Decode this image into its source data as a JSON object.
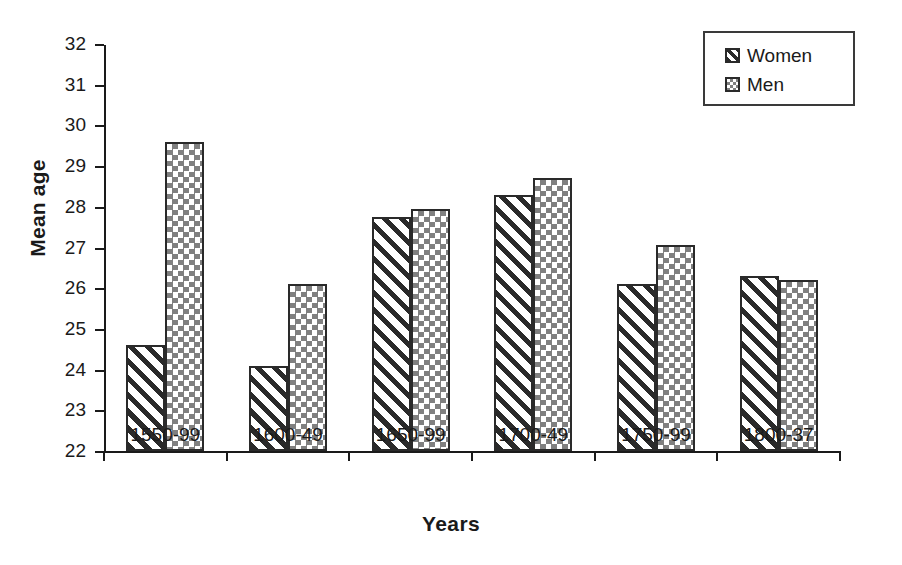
{
  "chart_data": {
    "type": "bar",
    "title": "",
    "xlabel": "Years",
    "ylabel": "Mean age",
    "categories": [
      "1550-99",
      "1600-49",
      "1650-99",
      "1700-49",
      "1750-99",
      "1800-37"
    ],
    "series": [
      {
        "name": "Women",
        "values": [
          24.6,
          24.1,
          27.75,
          28.3,
          26.1,
          26.3
        ]
      },
      {
        "name": "Men",
        "values": [
          29.6,
          26.1,
          27.95,
          28.7,
          27.05,
          26.2
        ]
      }
    ],
    "ylim": [
      22,
      32
    ],
    "ytick_labels": [
      "32",
      "31",
      "30",
      "29",
      "28",
      "27",
      "26",
      "25",
      "24",
      "23",
      "22"
    ],
    "ytick_values": [
      32,
      31,
      30,
      29,
      28,
      27,
      26,
      25,
      24,
      23,
      22
    ],
    "grid": false,
    "legend_position": "top-right",
    "legend_entries": [
      "Women",
      "Men"
    ]
  },
  "legend": {
    "items": [
      {
        "label": "Women",
        "pattern": "diagonal-hatch-swatch"
      },
      {
        "label": "Men",
        "pattern": "checkerboard-swatch"
      }
    ]
  },
  "axes": {
    "y_title": "Mean age",
    "x_title": "Years"
  }
}
